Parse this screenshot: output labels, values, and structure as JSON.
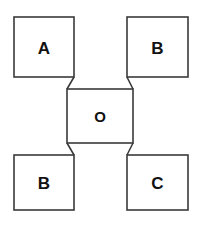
{
  "diagram": {
    "type": "node-connection-diagram",
    "background_color": "#ffffff",
    "stroke_color": "#3a3a3a",
    "label_color": "#111111",
    "nodes": [
      {
        "id": "top-left",
        "label": "A",
        "x": 14,
        "y": 17,
        "width": 60,
        "height": 60
      },
      {
        "id": "top-right",
        "label": "B",
        "x": 127,
        "y": 17,
        "width": 61,
        "height": 60
      },
      {
        "id": "center",
        "label": "O",
        "x": 67,
        "y": 89,
        "width": 66,
        "height": 54
      },
      {
        "id": "bottom-left",
        "label": "B",
        "x": 14,
        "y": 155,
        "width": 60,
        "height": 55
      },
      {
        "id": "bottom-right",
        "label": "C",
        "x": 127,
        "y": 155,
        "width": 61,
        "height": 55
      }
    ],
    "connectors": [
      {
        "id": "connector-top-left",
        "from": "top-left",
        "to": "center",
        "x1": 74,
        "y1": 77,
        "x2": 67,
        "y2": 89
      },
      {
        "id": "connector-top-right",
        "from": "top-right",
        "to": "center",
        "x1": 127,
        "y1": 77,
        "x2": 133,
        "y2": 89
      },
      {
        "id": "connector-bottom-left",
        "from": "bottom-left",
        "to": "center",
        "x1": 74,
        "y1": 155,
        "x2": 67,
        "y2": 143
      },
      {
        "id": "connector-bottom-right",
        "from": "bottom-right",
        "to": "center",
        "x1": 127,
        "y1": 155,
        "x2": 133,
        "y2": 143
      }
    ]
  }
}
